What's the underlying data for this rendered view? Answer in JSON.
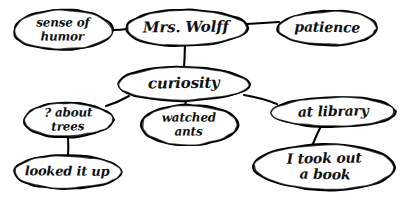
{
  "diagram": {
    "kind": "hand-drawn concept map",
    "background_color": "#ffffff",
    "ink_color": "#000000",
    "root": "Mrs. Wolff",
    "nodes": [
      {
        "id": "sense-of-humor",
        "lines": [
          "sense of",
          "humor"
        ],
        "text": "sense of humor",
        "cx": 63,
        "cy": 30,
        "rx": 50,
        "ry": 20,
        "font_size": 12
      },
      {
        "id": "mrs-wolff",
        "lines": [
          "Mrs. Wolff"
        ],
        "text": "Mrs. Wolff",
        "cx": 186,
        "cy": 28,
        "rx": 61,
        "ry": 18,
        "font_size": 15
      },
      {
        "id": "patience",
        "lines": [
          "patience"
        ],
        "text": "patience",
        "cx": 328,
        "cy": 28,
        "rx": 50,
        "ry": 17,
        "font_size": 14
      },
      {
        "id": "curiosity",
        "lines": [
          "curiosity"
        ],
        "text": "curiosity",
        "cx": 183,
        "cy": 84,
        "rx": 65,
        "ry": 17,
        "font_size": 15
      },
      {
        "id": "q-about-trees",
        "lines": [
          "? about",
          "trees"
        ],
        "text": "? about trees",
        "cx": 68,
        "cy": 120,
        "rx": 45,
        "ry": 17,
        "font_size": 12
      },
      {
        "id": "watched-ants",
        "lines": [
          "watched",
          "ants"
        ],
        "text": "watched ants",
        "cx": 189,
        "cy": 125,
        "rx": 49,
        "ry": 20,
        "font_size": 12
      },
      {
        "id": "at-library",
        "lines": [
          "at library"
        ],
        "text": "at library",
        "cx": 334,
        "cy": 112,
        "rx": 62,
        "ry": 15,
        "font_size": 14
      },
      {
        "id": "looked-it-up",
        "lines": [
          "looked it up"
        ],
        "text": "looked it up",
        "cx": 67,
        "cy": 172,
        "rx": 53,
        "ry": 17,
        "font_size": 13
      },
      {
        "id": "i-took-out-a-book",
        "lines": [
          "I took out",
          "a book"
        ],
        "text": "I took out a book",
        "cx": 325,
        "cy": 167,
        "rx": 70,
        "ry": 23,
        "font_size": 14
      }
    ],
    "edges": [
      {
        "id": "edge-humor-wolff",
        "from": "sense-of-humor",
        "to": "mrs-wolff",
        "x1": 113,
        "y1": 30,
        "x2": 126,
        "y2": 29
      },
      {
        "id": "edge-wolff-patience",
        "from": "mrs-wolff",
        "to": "patience",
        "x1": 247,
        "y1": 24,
        "x2": 279,
        "y2": 22
      },
      {
        "id": "edge-wolff-curiosity",
        "from": "mrs-wolff",
        "to": "curiosity",
        "x1": 185,
        "y1": 44,
        "x2": 184,
        "y2": 68
      },
      {
        "id": "edge-curiosity-trees",
        "from": "curiosity",
        "to": "q-about-trees",
        "x1": 129,
        "y1": 96,
        "x2": 106,
        "y2": 106
      },
      {
        "id": "edge-curiosity-ants",
        "from": "curiosity",
        "to": "watched-ants",
        "x1": 186,
        "y1": 101,
        "x2": 186,
        "y2": 107
      },
      {
        "id": "edge-curiosity-library",
        "from": "curiosity",
        "to": "at-library",
        "x1": 244,
        "y1": 95,
        "x2": 277,
        "y2": 104
      },
      {
        "id": "edge-trees-looked",
        "from": "q-about-trees",
        "to": "looked-it-up",
        "x1": 68,
        "y1": 137,
        "x2": 68,
        "y2": 156
      },
      {
        "id": "edge-library-book",
        "from": "at-library",
        "to": "i-took-out-a-book",
        "x1": 322,
        "y1": 124,
        "x2": 312,
        "y2": 146
      }
    ]
  }
}
